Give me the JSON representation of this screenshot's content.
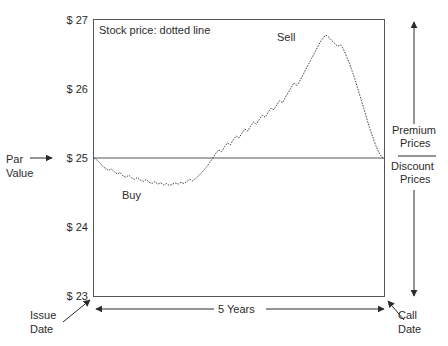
{
  "chart_data": {
    "type": "line",
    "title": "Stock price: dotted line",
    "xlabel": "5 Years",
    "ylabel": "",
    "xlim": [
      0,
      5
    ],
    "ylim": [
      23,
      27
    ],
    "grid": false,
    "legend_position": "none",
    "y_ticks": [
      "$ 23",
      "$ 24",
      "$ 25",
      "$ 26",
      "$ 27"
    ],
    "y_tick_values": [
      23,
      24,
      25,
      26,
      27
    ],
    "reference_line": {
      "label": "Par Value",
      "value": 25
    },
    "annotations": [
      {
        "name": "buy",
        "text": "Buy",
        "x": 0.55,
        "y": 24.45
      },
      {
        "name": "sell",
        "text": "Sell",
        "x": 3.2,
        "y": 26.7
      },
      {
        "name": "issue-date",
        "text": "Issue Date",
        "x": 0,
        "y": 23
      },
      {
        "name": "call-date",
        "text": "Call Date",
        "x": 5,
        "y": 23
      },
      {
        "name": "premium-prices",
        "text": "Premium Prices"
      },
      {
        "name": "discount-prices",
        "text": "Discount Prices"
      }
    ],
    "series": [
      {
        "name": "Stock price",
        "style": "dotted line",
        "x": [
          0.0,
          0.05,
          0.1,
          0.15,
          0.2,
          0.25,
          0.3,
          0.35,
          0.4,
          0.45,
          0.5,
          0.55,
          0.6,
          0.65,
          0.7,
          0.75,
          0.8,
          0.85,
          0.9,
          0.95,
          1.0,
          1.05,
          1.1,
          1.15,
          1.2,
          1.25,
          1.3,
          1.35,
          1.4,
          1.45,
          1.5,
          1.55,
          1.6,
          1.65,
          1.7,
          1.75,
          1.8,
          1.85,
          1.9,
          1.95,
          2.0,
          2.05,
          2.1,
          2.15,
          2.2,
          2.25,
          2.3,
          2.35,
          2.4,
          2.45,
          2.5,
          2.55,
          2.6,
          2.65,
          2.7,
          2.75,
          2.8,
          2.85,
          2.9,
          2.95,
          3.0,
          3.05,
          3.1,
          3.15,
          3.2,
          3.25,
          3.3,
          3.35,
          3.4,
          3.45,
          3.5,
          3.55,
          3.6,
          3.65,
          3.7,
          3.75,
          3.8,
          3.85,
          3.9,
          3.95,
          4.0,
          4.05,
          4.1,
          4.15,
          4.2,
          4.25,
          4.3,
          4.35,
          4.4,
          4.45,
          4.5,
          4.55,
          4.6,
          4.65,
          4.7,
          4.75,
          4.8,
          4.85,
          4.9,
          4.95,
          5.0
        ],
        "y": [
          25.0,
          24.97,
          24.93,
          24.88,
          24.85,
          24.82,
          24.84,
          24.8,
          24.77,
          24.79,
          24.74,
          24.72,
          24.75,
          24.71,
          24.69,
          24.72,
          24.68,
          24.66,
          24.69,
          24.65,
          24.63,
          24.66,
          24.62,
          24.64,
          24.61,
          24.63,
          24.6,
          24.62,
          24.64,
          24.62,
          24.65,
          24.63,
          24.66,
          24.69,
          24.67,
          24.7,
          24.74,
          24.78,
          24.83,
          24.88,
          24.94,
          25.0,
          25.07,
          25.12,
          25.09,
          25.16,
          25.22,
          25.19,
          25.26,
          25.32,
          25.29,
          25.36,
          25.42,
          25.39,
          25.46,
          25.52,
          25.49,
          25.56,
          25.62,
          25.59,
          25.66,
          25.72,
          25.7,
          25.77,
          25.83,
          25.8,
          25.88,
          25.95,
          26.02,
          26.09,
          26.05,
          26.12,
          26.2,
          26.28,
          26.36,
          26.44,
          26.52,
          26.6,
          26.68,
          26.74,
          26.78,
          26.75,
          26.7,
          26.66,
          26.62,
          26.64,
          26.58,
          26.48,
          26.38,
          26.26,
          26.14,
          26.0,
          25.86,
          25.72,
          25.58,
          25.44,
          25.32,
          25.2,
          25.1,
          25.03,
          24.98
        ]
      }
    ]
  },
  "labels": {
    "title": "Stock price: dotted line",
    "buy": "Buy",
    "sell": "Sell",
    "par_line1": "Par",
    "par_line2": "Value",
    "premium": "Premium",
    "prices_top": "Prices",
    "discount": "Discount",
    "prices_bottom": "Prices",
    "issue_line1": "Issue",
    "issue_line2": "Date",
    "call_line1": "Call",
    "call_line2": "Date",
    "years": "5 Years"
  },
  "y_ticks": {
    "t27": "$ 27",
    "t26": "$ 26",
    "t25": "$ 25",
    "t24": "$ 24",
    "t23": "$ 23"
  },
  "colors": {
    "line": "#4a4a4a",
    "frame": "#555555",
    "text": "#2b2b2b",
    "background": "#ffffff"
  }
}
